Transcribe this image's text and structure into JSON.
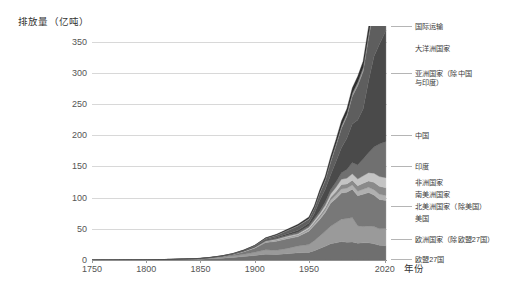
{
  "chart_data": {
    "type": "area",
    "title": "",
    "subtitle": "",
    "ylabel": "排放量（亿吨）",
    "xlabel": "年份",
    "ylim": [
      0,
      375
    ],
    "xlim": [
      1750,
      2022
    ],
    "grid": true,
    "stacked": true,
    "legend_position": "right-outside",
    "ytick_labels": [
      "0",
      "50",
      "100",
      "150",
      "200",
      "250",
      "300",
      "350"
    ],
    "ytick_values": [
      0,
      50,
      100,
      150,
      200,
      250,
      300,
      350
    ],
    "xtick_labels": [
      "1750",
      "1800",
      "1850",
      "1900",
      "1950",
      "2020"
    ],
    "xtick_values": [
      1750,
      1800,
      1850,
      1900,
      1950,
      2020
    ],
    "x": [
      1750,
      1775,
      1800,
      1825,
      1850,
      1860,
      1870,
      1880,
      1890,
      1900,
      1910,
      1920,
      1930,
      1940,
      1950,
      1955,
      1960,
      1965,
      1970,
      1975,
      1980,
      1985,
      1990,
      1995,
      2000,
      2005,
      2010,
      2015,
      2021
    ],
    "series": [
      {
        "name": "欧盟27国",
        "color": "#6f6f6f",
        "values": [
          0.0,
          0.1,
          0.2,
          0.5,
          1.3,
          2.1,
          3.0,
          4.2,
          5.6,
          7.3,
          9.4,
          9.0,
          10.0,
          11.5,
          12.2,
          15.0,
          18.5,
          22.0,
          26.0,
          27.5,
          29.5,
          28.5,
          29.0,
          27.0,
          27.5,
          27.5,
          26.0,
          23.5,
          23.0
        ]
      },
      {
        "name": "欧洲国家（除欧盟27国）",
        "color": "#9a9a9a",
        "values": [
          0.0,
          0.1,
          0.2,
          0.4,
          0.8,
          1.2,
          1.8,
          2.6,
          3.6,
          5.0,
          7.0,
          6.5,
          8.5,
          11.0,
          12.5,
          16.0,
          20.0,
          24.0,
          28.0,
          32.0,
          36.0,
          38.0,
          39.0,
          28.0,
          26.0,
          27.0,
          27.5,
          26.5,
          27.5
        ]
      },
      {
        "name": "美国",
        "color": "#787878",
        "values": [
          0.0,
          0.0,
          0.0,
          0.1,
          0.2,
          0.6,
          1.0,
          2.0,
          4.0,
          6.6,
          11.5,
          14.5,
          15.5,
          15.0,
          21.5,
          24.5,
          26.5,
          30.0,
          37.0,
          39.0,
          42.0,
          42.0,
          45.5,
          48.0,
          52.0,
          53.5,
          50.5,
          47.0,
          45.0
        ]
      },
      {
        "name": "北美洲国家（除美国）",
        "color": "#b0b0b0",
        "values": [
          0.0,
          0.0,
          0.0,
          0.0,
          0.0,
          0.1,
          0.1,
          0.2,
          0.4,
          0.6,
          1.1,
          1.4,
          1.6,
          1.8,
          2.2,
          2.7,
          3.2,
          3.8,
          4.8,
          5.6,
          6.4,
          6.6,
          6.8,
          7.2,
          7.8,
          8.4,
          8.6,
          8.4,
          8.0
        ]
      },
      {
        "name": "南美洲国家",
        "color": "#8a8a8a",
        "values": [
          0.0,
          0.0,
          0.0,
          0.0,
          0.0,
          0.0,
          0.1,
          0.1,
          0.2,
          0.3,
          0.5,
          0.8,
          1.0,
          1.2,
          1.8,
          2.4,
          3.0,
          3.6,
          4.6,
          5.8,
          7.0,
          6.8,
          7.6,
          8.6,
          9.8,
          10.4,
          11.8,
          12.6,
          12.4
        ]
      },
      {
        "name": "非洲国家",
        "color": "#c4c4c4",
        "values": [
          0.0,
          0.0,
          0.0,
          0.0,
          0.0,
          0.0,
          0.1,
          0.1,
          0.2,
          0.4,
          0.7,
          1.0,
          1.3,
          1.6,
          2.2,
          2.8,
          3.5,
          4.3,
          5.4,
          6.8,
          8.4,
          9.2,
          10.2,
          11.0,
          11.8,
          13.2,
          14.6,
          15.8,
          16.0
        ]
      },
      {
        "name": "印度",
        "color": "#707070",
        "values": [
          0.0,
          0.0,
          0.0,
          0.0,
          0.1,
          0.1,
          0.2,
          0.3,
          0.5,
          0.8,
          1.2,
          1.6,
          1.8,
          2.2,
          2.5,
          3.0,
          4.0,
          5.2,
          6.6,
          8.2,
          10.5,
          14.0,
          18.0,
          22.5,
          27.0,
          32.0,
          42.0,
          52.0,
          58.0
        ]
      },
      {
        "name": "中国",
        "color": "#4a4a4a",
        "values": [
          0.0,
          0.0,
          0.0,
          0.0,
          0.1,
          0.1,
          0.2,
          0.3,
          0.4,
          0.6,
          0.9,
          1.5,
          2.5,
          3.5,
          4.5,
          8.0,
          17.0,
          20.0,
          24.0,
          33.0,
          40.0,
          50.0,
          62.0,
          72.0,
          80.0,
          115.0,
          145.0,
          160.0,
          178.0
        ]
      },
      {
        "name": "亚洲国家（除中国与印度）",
        "color": "#5e5e5e",
        "values": [
          0.0,
          0.0,
          0.0,
          0.0,
          0.1,
          0.1,
          0.2,
          0.4,
          0.7,
          1.2,
          2.0,
          3.0,
          4.5,
          6.5,
          6.0,
          8.0,
          11.0,
          14.0,
          20.0,
          25.0,
          31.0,
          35.0,
          44.0,
          55.0,
          60.0,
          68.0,
          78.0,
          86.0,
          90.0
        ]
      },
      {
        "name": "大洋洲国家",
        "color": "#969696",
        "values": [
          0.0,
          0.0,
          0.0,
          0.0,
          0.0,
          0.0,
          0.0,
          0.1,
          0.2,
          0.3,
          0.5,
          0.7,
          0.8,
          1.0,
          1.2,
          1.5,
          1.9,
          2.3,
          2.9,
          3.4,
          4.0,
          4.4,
          4.9,
          5.4,
          6.0,
          6.4,
          6.8,
          7.0,
          6.8
        ]
      },
      {
        "name": "国际运输",
        "color": "#2e2e2e",
        "values": [
          0.0,
          0.0,
          0.0,
          0.0,
          0.0,
          0.1,
          0.1,
          0.2,
          0.3,
          0.5,
          0.8,
          1.2,
          1.6,
          2.0,
          2.4,
          3.0,
          3.8,
          4.6,
          6.0,
          7.0,
          8.0,
          7.8,
          8.6,
          9.6,
          10.6,
          11.8,
          12.6,
          13.4,
          12.5
        ]
      }
    ],
    "legend_labels": [
      "国际运输",
      "大洋洲国家",
      "亚洲国家（除中国\n与印度）",
      "中国",
      "印度",
      "非洲国家",
      "南美洲国家",
      "北美洲国家（除美国）",
      "美国",
      "欧洲国家（除欧盟27国）",
      "欧盟27国"
    ]
  }
}
